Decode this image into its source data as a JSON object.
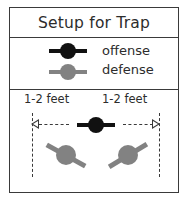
{
  "title": "Setup for Trap",
  "legend": {
    "items": [
      {
        "label": "offense",
        "marker": "player-marker-black",
        "color": "#111111"
      },
      {
        "label": "defense",
        "marker": "player-marker-gray",
        "color": "#828282"
      }
    ]
  },
  "diagram": {
    "spacing_label_left": "1-2 feet",
    "spacing_label_right": "1-2 feet",
    "arrow_left": "arrow-left-outline",
    "arrow_right": "arrow-right-outline",
    "players": [
      {
        "role": "offense",
        "position": "center",
        "color": "#111111"
      },
      {
        "role": "defense",
        "position": "left",
        "color": "#828282"
      },
      {
        "role": "defense",
        "position": "right",
        "color": "#828282"
      }
    ]
  },
  "colors": {
    "offense": "#111111",
    "defense": "#828282",
    "border": "#3a3a3a",
    "text": "#2c2c2c",
    "background": "#ffffff"
  }
}
